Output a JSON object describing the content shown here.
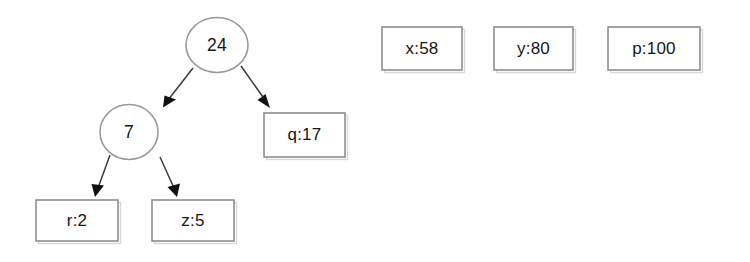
{
  "diagram": {
    "type": "binary-tree-with-detached-nodes",
    "background_color": "#ffffff",
    "stroke_color": "#8e8e8e",
    "text_color": "#161616",
    "arrow_color": "#111111",
    "tree": {
      "root": {
        "id": "node-24",
        "shape": "ellipse",
        "label": "24",
        "cx": 217,
        "cy": 45,
        "rx": 31,
        "ry": 27.5
      },
      "internal": [
        {
          "id": "node-7",
          "shape": "ellipse",
          "label": "7",
          "cx": 129,
          "cy": 132,
          "rx": 29,
          "ry": 27.5
        }
      ],
      "leaves": [
        {
          "id": "leaf-q17",
          "shape": "rect",
          "label": "q:17",
          "x": 264,
          "y": 113,
          "width": 81,
          "height": 44
        },
        {
          "id": "leaf-r2",
          "shape": "rect",
          "label": "r:2",
          "x": 36,
          "y": 200,
          "width": 82,
          "height": 41
        },
        {
          "id": "leaf-z5",
          "shape": "rect",
          "label": "z:5",
          "x": 152,
          "y": 200,
          "width": 82,
          "height": 41
        }
      ],
      "edges": [
        {
          "id": "edge-24-7",
          "from": "node-24",
          "to": "node-7",
          "x1": 193,
          "y1": 68,
          "x2": 163,
          "y2": 107
        },
        {
          "id": "edge-24-q17",
          "from": "node-24",
          "to": "leaf-q17",
          "x1": 241,
          "y1": 66,
          "x2": 270,
          "y2": 108
        },
        {
          "id": "edge-7-r2",
          "from": "node-7",
          "to": "leaf-r2",
          "x1": 110,
          "y1": 155,
          "x2": 95,
          "y2": 197
        },
        {
          "id": "edge-7-z5",
          "from": "node-7",
          "to": "leaf-z5",
          "x1": 160,
          "y1": 157,
          "x2": 177,
          "y2": 197
        }
      ]
    },
    "detached_nodes": [
      {
        "id": "box-x58",
        "shape": "rect",
        "label": "x:58",
        "x": 382,
        "y": 27,
        "width": 80,
        "height": 43
      },
      {
        "id": "box-y80",
        "shape": "rect",
        "label": "y:80",
        "x": 494,
        "y": 27,
        "width": 79,
        "height": 43
      },
      {
        "id": "box-p100",
        "shape": "rect",
        "label": "p:100",
        "x": 608,
        "y": 27,
        "width": 92,
        "height": 43
      }
    ]
  }
}
